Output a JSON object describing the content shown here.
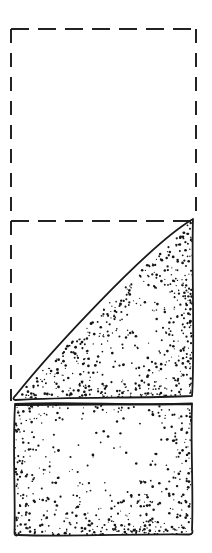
{
  "figure": {
    "title": "Paper folding diagram",
    "style": "pen-and-ink line art with stipple shading",
    "canvas": {
      "width": 212,
      "height": 553
    },
    "colors": {
      "background": "#ffffff",
      "ink": "#1a1a1a",
      "stipple": "#151515",
      "dashed_guide": "#222222"
    },
    "strokes": {
      "solid_width": 1.8,
      "dashed_width": 2.0,
      "dash_horizontal": "18 9",
      "dash_vertical": "14 10"
    },
    "elements": [
      {
        "name": "dashed-outline-rectangle",
        "kind": "dashed-rectangle",
        "label": "Original sheet outline",
        "x": 11,
        "y": 29,
        "width": 185,
        "height": 372
      },
      {
        "name": "dashed-fold-line",
        "kind": "dashed-horizontal-line",
        "label": "Fold crease guide",
        "x1": 11,
        "x2": 196,
        "y": 221
      },
      {
        "name": "folded-flap",
        "kind": "stippled-triangle",
        "label": "Folded-down triangular flap",
        "apex_x": 193,
        "apex_y": 219,
        "left_x": 14,
        "left_y": 399,
        "right_x": 192,
        "right_y": 396
      },
      {
        "name": "lower-panel",
        "kind": "stippled-rectangle",
        "label": "Lower sheet panel",
        "x": 14,
        "y": 404,
        "width": 178,
        "height": 131
      }
    ],
    "stipple_seed": 20240517,
    "stipple_counts": {
      "flap": 560,
      "lower_panel": 520
    }
  }
}
